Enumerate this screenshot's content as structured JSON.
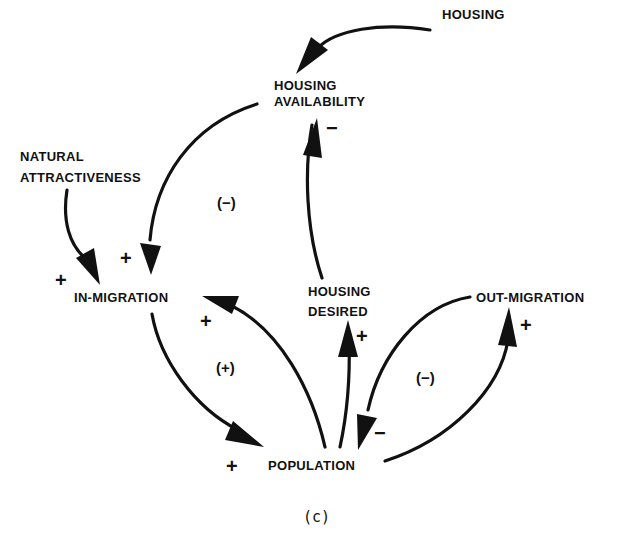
{
  "diagram": {
    "type": "causal-loop-diagram",
    "caption": "(c)",
    "nodes": [
      {
        "id": "housing",
        "label": "HOUSING"
      },
      {
        "id": "housing_availability",
        "label_lines": [
          "HOUSING",
          "AVAILABILITY"
        ]
      },
      {
        "id": "natural_attractiveness",
        "label_lines": [
          "NATURAL",
          "ATTRACTIVENESS"
        ]
      },
      {
        "id": "in_migration",
        "label": "IN-MIGRATION"
      },
      {
        "id": "housing_desired",
        "label_lines": [
          "HOUSING",
          "DESIRED"
        ]
      },
      {
        "id": "out_migration",
        "label": "OUT-MIGRATION"
      },
      {
        "id": "population",
        "label": "POPULATION"
      }
    ],
    "edges": [
      {
        "from": "housing",
        "to": "housing_availability",
        "polarity": "+"
      },
      {
        "from": "housing_desired",
        "to": "housing_availability",
        "polarity": "−"
      },
      {
        "from": "housing_availability",
        "to": "in_migration",
        "polarity": "+"
      },
      {
        "from": "natural_attractiveness",
        "to": "in_migration",
        "polarity": "+"
      },
      {
        "from": "in_migration",
        "to": "population",
        "polarity": "+"
      },
      {
        "from": "population",
        "to": "in_migration",
        "polarity": "+"
      },
      {
        "from": "population",
        "to": "housing_desired",
        "polarity": "+"
      },
      {
        "from": "population",
        "to": "out_migration",
        "polarity": "+"
      },
      {
        "from": "out_migration",
        "to": "population",
        "polarity": "−"
      }
    ],
    "loops": [
      {
        "label": "(−)",
        "between": [
          "housing_availability",
          "in_migration",
          "population",
          "housing_desired"
        ]
      },
      {
        "label": "(+)",
        "between": [
          "in_migration",
          "population"
        ]
      },
      {
        "label": "(−)",
        "between": [
          "population",
          "out_migration"
        ]
      }
    ],
    "text": {
      "housing": "HOUSING",
      "ha_line1": "HOUSING",
      "ha_line2": "AVAILABILITY",
      "na_line1": "NATURAL",
      "na_line2": "ATTRACTIVENESS",
      "in_migration": "IN-MIGRATION",
      "hd_line1": "HOUSING",
      "hd_line2": "DESIRED",
      "out_migration": "OUT-MIGRATION",
      "population": "POPULATION",
      "plus": "+",
      "minus": "−",
      "loop_neg": "(−)",
      "loop_pos": "(+)",
      "caption": "(c)"
    }
  }
}
